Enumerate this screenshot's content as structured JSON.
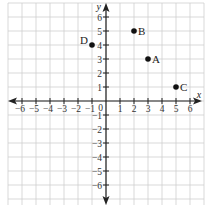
{
  "graph": {
    "title": "",
    "x_axis_label": "x",
    "y_axis_label": "y",
    "origin_label": "0",
    "x_range": [
      -7,
      7
    ],
    "y_range": [
      -7,
      7
    ],
    "x_ticks": [
      -6,
      -5,
      -4,
      -3,
      -2,
      -1,
      1,
      2,
      3,
      4,
      5,
      6
    ],
    "y_ticks": [
      6,
      5,
      4,
      3,
      2,
      1,
      -1,
      -2,
      -3,
      -4,
      -5,
      -6
    ],
    "points": [
      {
        "label": "A",
        "x": 3,
        "y": 3
      },
      {
        "label": "B",
        "x": 2,
        "y": 5
      },
      {
        "label": "C",
        "x": 5,
        "y": 1
      },
      {
        "label": "D",
        "x": -1,
        "y": 4
      }
    ],
    "colors": {
      "grid": "#cfcfcf",
      "axis": "#222222",
      "point": "#111111"
    }
  },
  "chart_data": {
    "type": "scatter",
    "title": "",
    "xlabel": "x",
    "ylabel": "y",
    "xlim": [
      -7,
      7
    ],
    "ylim": [
      -7,
      7
    ],
    "grid": true,
    "series": [
      {
        "name": "points",
        "x": [
          3,
          2,
          5,
          -1
        ],
        "y": [
          3,
          5,
          1,
          4
        ],
        "labels": [
          "A",
          "B",
          "C",
          "D"
        ]
      }
    ]
  }
}
